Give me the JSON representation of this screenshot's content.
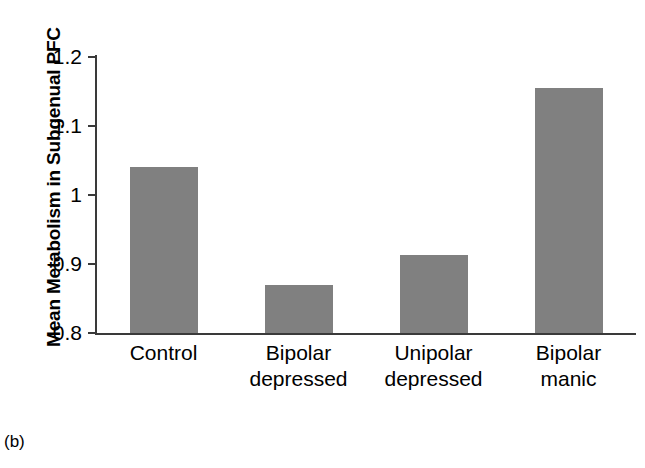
{
  "figure": {
    "panel_caption": "(b)",
    "y_axis_title": "Mean Metabolism in Subgenual PFC"
  },
  "chart_data": {
    "type": "bar",
    "title": "",
    "xlabel": "",
    "ylabel": "Mean Metabolism in Subgenual PFC",
    "categories": [
      "Control",
      "Bipolar depressed",
      "Unipolar depressed",
      "Bipolar manic"
    ],
    "category_lines": [
      [
        "Control"
      ],
      [
        "Bipolar",
        "depressed"
      ],
      [
        "Unipolar",
        "depressed"
      ],
      [
        "Bipolar",
        "manic"
      ]
    ],
    "values": [
      1.04,
      0.87,
      0.913,
      1.155
    ],
    "ylim": [
      0.8,
      1.2
    ],
    "yticks": [
      0.8,
      0.9,
      1,
      1.1,
      1.2
    ],
    "ytick_labels": [
      "0.8",
      "0.9",
      "1",
      "1.1",
      "1.2"
    ],
    "grid": false,
    "legend": false,
    "bar_color": "#808080",
    "axis_color": "#3a3a3a"
  }
}
